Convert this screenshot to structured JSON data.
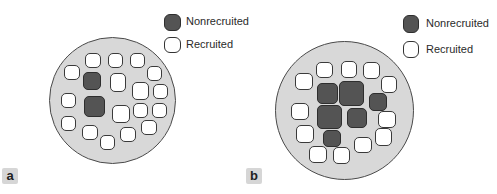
{
  "legend_labels": {
    "nonrecruited": "Nonrecruited",
    "recruited": "Recruited"
  },
  "panels": [
    {
      "label": "a",
      "disc": {
        "x": 49,
        "y": 37,
        "d": 127
      },
      "legend": {
        "dark": {
          "x": 164,
          "y": 14,
          "w": 17,
          "h": 17
        },
        "light": {
          "x": 164,
          "y": 37,
          "w": 17,
          "h": 16
        },
        "text_x": 186,
        "text_y1": 15,
        "text_y2": 38
      },
      "label_box": {
        "x": 2,
        "y": 168
      },
      "cells": [
        {
          "x": 85,
          "y": 53,
          "w": 16,
          "h": 15,
          "s": "recruited"
        },
        {
          "x": 108,
          "y": 53,
          "w": 15,
          "h": 15,
          "s": "recruited"
        },
        {
          "x": 130,
          "y": 53,
          "w": 15,
          "h": 15,
          "s": "recruited"
        },
        {
          "x": 64,
          "y": 65,
          "w": 16,
          "h": 15,
          "s": "recruited"
        },
        {
          "x": 147,
          "y": 66,
          "w": 15,
          "h": 15,
          "s": "recruited"
        },
        {
          "x": 83,
          "y": 72,
          "w": 18,
          "h": 18,
          "s": "nonrecruited"
        },
        {
          "x": 110,
          "y": 73,
          "w": 16,
          "h": 19,
          "s": "recruited"
        },
        {
          "x": 132,
          "y": 82,
          "w": 17,
          "h": 18,
          "s": "recruited"
        },
        {
          "x": 153,
          "y": 84,
          "w": 15,
          "h": 15,
          "s": "recruited"
        },
        {
          "x": 61,
          "y": 93,
          "w": 15,
          "h": 15,
          "s": "recruited"
        },
        {
          "x": 84,
          "y": 96,
          "w": 21,
          "h": 21,
          "s": "nonrecruited"
        },
        {
          "x": 112,
          "y": 105,
          "w": 18,
          "h": 18,
          "s": "recruited"
        },
        {
          "x": 133,
          "y": 103,
          "w": 15,
          "h": 15,
          "s": "recruited"
        },
        {
          "x": 152,
          "y": 103,
          "w": 15,
          "h": 15,
          "s": "recruited"
        },
        {
          "x": 61,
          "y": 116,
          "w": 15,
          "h": 15,
          "s": "recruited"
        },
        {
          "x": 141,
          "y": 120,
          "w": 16,
          "h": 15,
          "s": "recruited"
        },
        {
          "x": 82,
          "y": 125,
          "w": 16,
          "h": 15,
          "s": "recruited"
        },
        {
          "x": 120,
          "y": 127,
          "w": 16,
          "h": 15,
          "s": "recruited"
        },
        {
          "x": 100,
          "y": 135,
          "w": 15,
          "h": 15,
          "s": "recruited"
        }
      ]
    },
    {
      "label": "b",
      "disc": {
        "x": 275,
        "y": 41,
        "d": 139
      },
      "legend": {
        "dark": {
          "x": 403,
          "y": 15,
          "w": 16,
          "h": 18
        },
        "light": {
          "x": 403,
          "y": 41,
          "w": 16,
          "h": 17
        },
        "text_x": 426,
        "text_y1": 17,
        "text_y2": 43
      },
      "label_box": {
        "x": 246,
        "y": 168
      },
      "cells": [
        {
          "x": 316,
          "y": 62,
          "w": 17,
          "h": 16,
          "s": "recruited"
        },
        {
          "x": 341,
          "y": 61,
          "w": 16,
          "h": 17,
          "s": "recruited"
        },
        {
          "x": 363,
          "y": 62,
          "w": 17,
          "h": 17,
          "s": "recruited"
        },
        {
          "x": 295,
          "y": 73,
          "w": 18,
          "h": 17,
          "s": "recruited"
        },
        {
          "x": 381,
          "y": 76,
          "w": 16,
          "h": 17,
          "s": "recruited"
        },
        {
          "x": 317,
          "y": 83,
          "w": 21,
          "h": 21,
          "s": "nonrecruited"
        },
        {
          "x": 339,
          "y": 81,
          "w": 25,
          "h": 25,
          "s": "nonrecruited"
        },
        {
          "x": 369,
          "y": 93,
          "w": 18,
          "h": 18,
          "s": "nonrecruited"
        },
        {
          "x": 291,
          "y": 103,
          "w": 18,
          "h": 17,
          "s": "recruited"
        },
        {
          "x": 317,
          "y": 105,
          "w": 25,
          "h": 24,
          "s": "nonrecruited"
        },
        {
          "x": 347,
          "y": 108,
          "w": 20,
          "h": 20,
          "s": "nonrecruited"
        },
        {
          "x": 378,
          "y": 111,
          "w": 18,
          "h": 17,
          "s": "recruited"
        },
        {
          "x": 296,
          "y": 125,
          "w": 18,
          "h": 18,
          "s": "recruited"
        },
        {
          "x": 375,
          "y": 128,
          "w": 17,
          "h": 18,
          "s": "recruited"
        },
        {
          "x": 323,
          "y": 130,
          "w": 18,
          "h": 17,
          "s": "nonrecruited"
        },
        {
          "x": 354,
          "y": 137,
          "w": 18,
          "h": 16,
          "s": "recruited"
        },
        {
          "x": 309,
          "y": 146,
          "w": 18,
          "h": 17,
          "s": "recruited"
        },
        {
          "x": 333,
          "y": 147,
          "w": 17,
          "h": 17,
          "s": "recruited"
        }
      ]
    }
  ]
}
